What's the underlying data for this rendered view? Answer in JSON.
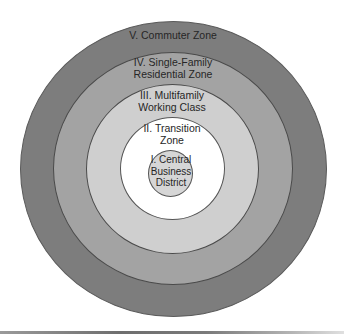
{
  "diagram": {
    "type": "concentric-zone-model",
    "zones": [
      {
        "id": "I",
        "lines": [
          "I. Central",
          "Business",
          "District"
        ],
        "color": "#d6d6d6"
      },
      {
        "id": "II",
        "lines": [
          "II. Transition",
          "Zone"
        ],
        "color": "#ffffff"
      },
      {
        "id": "III",
        "lines": [
          "III. Multifamily",
          "Working Class"
        ],
        "color": "#cfcfcf"
      },
      {
        "id": "IV",
        "lines": [
          "IV. Single-Family",
          "Residential Zone"
        ],
        "color": "#a3a3a3"
      },
      {
        "id": "V",
        "lines": [
          "V. Commuter Zone"
        ],
        "color": "#7d7d7d"
      }
    ]
  }
}
